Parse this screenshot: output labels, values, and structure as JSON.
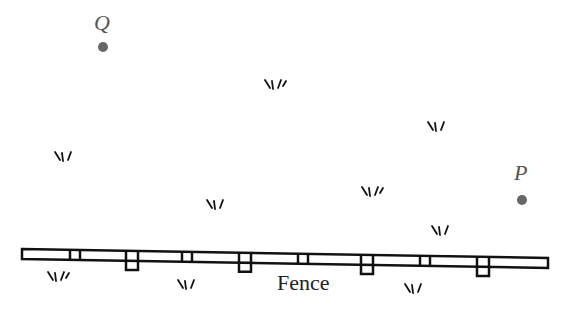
{
  "diagram": {
    "points": [
      {
        "id": "Q",
        "label": "Q",
        "x": 103,
        "y": 47,
        "label_x": 94,
        "label_y": 12
      },
      {
        "id": "P",
        "label": "P",
        "x": 522,
        "y": 200,
        "label_x": 514,
        "label_y": 162
      }
    ],
    "fence": {
      "label": "Fence",
      "label_x": 277,
      "label_y": 272,
      "x_start": 22,
      "x_end": 548,
      "y_start": 249,
      "y_end": 258,
      "rail_height": 10,
      "inline_posts_x": [
        75,
        187,
        303,
        425
      ],
      "hanging_posts_x": [
        132,
        245,
        367,
        483
      ]
    },
    "grass_tufts": [
      {
        "x": 265,
        "y": 80
      },
      {
        "x": 428,
        "y": 122
      },
      {
        "x": 55,
        "y": 152
      },
      {
        "x": 362,
        "y": 187
      },
      {
        "x": 207,
        "y": 200
      },
      {
        "x": 432,
        "y": 226
      },
      {
        "x": 48,
        "y": 272
      },
      {
        "x": 178,
        "y": 280
      },
      {
        "x": 405,
        "y": 284
      }
    ],
    "colors": {
      "point": "#666666",
      "label": "#555555",
      "stroke": "#111111",
      "background": "#ffffff"
    }
  }
}
